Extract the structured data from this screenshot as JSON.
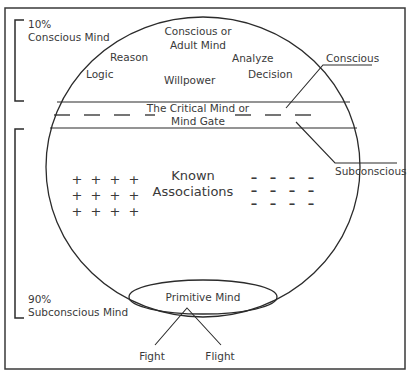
{
  "diagram": {
    "top_bracket": {
      "percent": "10%",
      "label": "Conscious Mind"
    },
    "bottom_bracket": {
      "percent": "90%",
      "label": "Subconscious Mind"
    },
    "conscious_zone": {
      "title_line1": "Conscious or",
      "title_line2": "Adult Mind",
      "terms": {
        "reason": "Reason",
        "logic": "Logic",
        "willpower": "Willpower",
        "analyze": "Analyze",
        "decision": "Decision"
      }
    },
    "critical_mind": {
      "line1": "The Critical Mind or",
      "line2": "Mind Gate"
    },
    "callouts": {
      "conscious": "Conscious",
      "subconscious": "Subconscious"
    },
    "associations": {
      "line1": "Known",
      "line2": "Associations",
      "positive_symbol": "+",
      "negative_symbol": "–",
      "positive_grid": {
        "rows": 3,
        "cols": 4
      },
      "negative_grid": {
        "rows": 3,
        "cols": 4
      }
    },
    "primitive_mind": {
      "label": "Primitive Mind",
      "outputs": [
        "Fight",
        "Flight"
      ]
    }
  }
}
